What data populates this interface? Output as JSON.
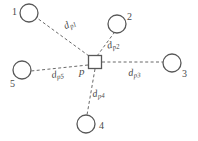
{
  "figure": {
    "stroke_color": "#585858",
    "background_color": "#ffffff",
    "edge_style": "dashed"
  },
  "center_node": {
    "label": "p",
    "shape": "square",
    "x": 95,
    "y": 62,
    "size": 13
  },
  "nodes": [
    {
      "id": "1",
      "label": "1",
      "shape": "circle",
      "cx": 29,
      "cy": 13,
      "r": 9,
      "label_x": 12,
      "label_y": 9
    },
    {
      "id": "2",
      "label": "2",
      "shape": "circle",
      "cx": 117,
      "cy": 24,
      "r": 9,
      "label_x": 127,
      "label_y": 14
    },
    {
      "id": "3",
      "label": "3",
      "shape": "circle",
      "cx": 172,
      "cy": 63,
      "r": 9,
      "label_x": 182,
      "label_y": 71
    },
    {
      "id": "4",
      "label": "4",
      "shape": "circle",
      "cx": 86,
      "cy": 124,
      "r": 9,
      "label_x": 98,
      "label_y": 123
    },
    {
      "id": "5",
      "label": "5",
      "shape": "circle",
      "cx": 22,
      "cy": 70,
      "r": 9,
      "label_x": 10,
      "label_y": 80
    }
  ],
  "edges": [
    {
      "id": "e1",
      "from": "p",
      "to": "1",
      "label_main": "d",
      "label_sub": "p1",
      "label_x": 62,
      "label_y": 23,
      "rotate": -26
    },
    {
      "id": "e2",
      "from": "p",
      "to": "2",
      "label_main": "d",
      "label_sub": "p2",
      "label_x": 106,
      "label_y": 42,
      "rotate": -12
    },
    {
      "id": "e3",
      "from": "p",
      "to": "3",
      "label_main": "d",
      "label_sub": "p3",
      "label_x": 128,
      "label_y": 69,
      "rotate": -4
    },
    {
      "id": "e4",
      "from": "p",
      "to": "4",
      "label_main": "d",
      "label_sub": "p4",
      "label_x": 92,
      "label_y": 90,
      "rotate": -6
    },
    {
      "id": "e5",
      "from": "p",
      "to": "5",
      "label_main": "d",
      "label_sub": "p5",
      "label_x": 51,
      "label_y": 71,
      "rotate": -8
    }
  ],
  "center_label_pos": {
    "x": 79,
    "y": 68
  }
}
